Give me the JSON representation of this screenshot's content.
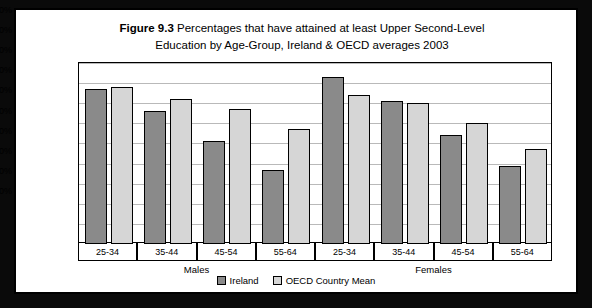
{
  "figure": {
    "number": "Figure 9.3",
    "title_line1": "Percentages that have attained at least Upper Second-Level",
    "title_line2": "Education by Age-Group, Ireland & OECD averages 2003"
  },
  "legend": {
    "position": "bottom-center",
    "items": [
      {
        "name": "Ireland",
        "color": "#8a8a8a"
      },
      {
        "name": "OECD Country Mean",
        "color": "#d6d6d6"
      }
    ]
  },
  "groups": [
    {
      "label": "Males"
    },
    {
      "label": "Females"
    }
  ],
  "chart_data": {
    "type": "bar",
    "title": "Figure 9.3  Percentages that have attained at least Upper Second-Level Education by Age-Group, Ireland & OECD averages 2003",
    "xlabel": "",
    "ylabel": "",
    "ylim": [
      0,
      90
    ],
    "ytick_labels": [
      "0%",
      "10%",
      "20%",
      "30%",
      "40%",
      "50%",
      "60%",
      "70%",
      "80%",
      "90%"
    ],
    "ytick_values": [
      0,
      10,
      20,
      30,
      40,
      50,
      60,
      70,
      80,
      90
    ],
    "grid": true,
    "categories": [
      "25-34",
      "35-44",
      "45-54",
      "55-64",
      "25-34",
      "35-44",
      "45-54",
      "55-64"
    ],
    "group_labels": [
      "Males",
      "Males",
      "Males",
      "Males",
      "Females",
      "Females",
      "Females",
      "Females"
    ],
    "series": [
      {
        "name": "Ireland",
        "color": "#8a8a8a",
        "values": [
          77,
          66,
          51,
          37,
          83,
          71,
          54,
          39
        ]
      },
      {
        "name": "OECD Country Mean",
        "color": "#d6d6d6",
        "values": [
          78,
          72,
          67,
          57,
          74,
          70,
          60,
          47
        ]
      }
    ]
  }
}
